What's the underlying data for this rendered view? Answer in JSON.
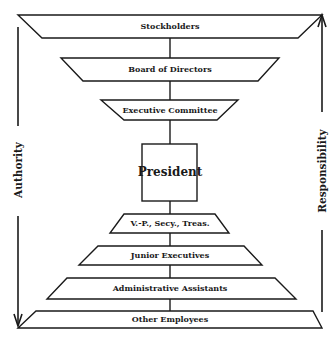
{
  "diagram": {
    "levels": [
      {
        "id": "stockholders",
        "label": "Stockholders"
      },
      {
        "id": "board",
        "label": "Board of Directors"
      },
      {
        "id": "executive-committee",
        "label": "Executive Committee"
      },
      {
        "id": "president",
        "label": "President"
      },
      {
        "id": "officers",
        "label": "V.-P., Secy., Treas."
      },
      {
        "id": "junior-executives",
        "label": "Junior Executives"
      },
      {
        "id": "administrative-assistants",
        "label": "Administrative Assistants"
      },
      {
        "id": "other-employees",
        "label": "Other Employees"
      }
    ],
    "left_axis": {
      "label": "Authority",
      "direction": "down"
    },
    "right_axis": {
      "label": "Responsibility",
      "direction": "up"
    },
    "colors": {
      "ink": "#1a1a1a",
      "background": "#ffffff"
    }
  }
}
